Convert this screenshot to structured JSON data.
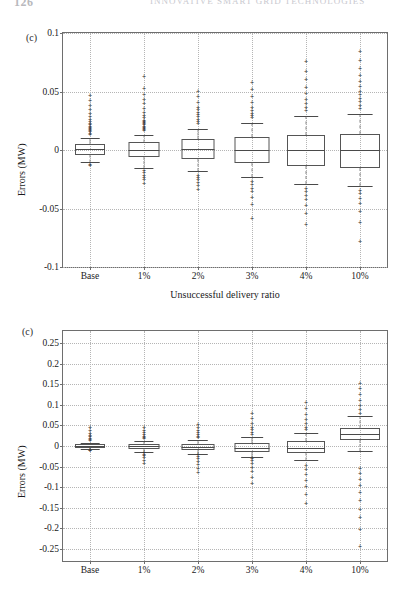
{
  "header": {
    "folio": "126",
    "running_title": "Innovative Smart Grid Technologies"
  },
  "panels": [
    {
      "tag": "(c)",
      "ylabel": "Errors (MW)",
      "xlabel": "Unsuccessful delivery ratio",
      "yticks": [
        "0.1",
        "0.05",
        "0",
        "-0.05",
        "-0.1"
      ],
      "xticks": [
        "Base",
        "1%",
        "2%",
        "3%",
        "4%",
        "10%"
      ]
    },
    {
      "tag": "(c)",
      "ylabel": "Errors (MW)",
      "xlabel": "",
      "yticks": [
        "0.25",
        "0.2",
        "0.15",
        "0.1",
        "0.05",
        "0",
        "-0.05",
        "-0.1",
        "-0.15",
        "-0.2",
        "-0.25"
      ],
      "xticks": [
        "Base",
        "1%",
        "2%",
        "3%",
        "4%",
        "10%"
      ]
    }
  ],
  "chart_data": [
    {
      "type": "box",
      "title": "(c)",
      "xlabel": "Unsuccessful delivery ratio",
      "ylabel": "Errors (MW)",
      "categories": [
        "Base",
        "1%",
        "2%",
        "3%",
        "4%",
        "10%"
      ],
      "ylim": [
        -0.1,
        0.1
      ],
      "yticks": [
        0.1,
        0.05,
        0,
        -0.05,
        -0.1
      ],
      "grid": true,
      "legend": "none",
      "boxes": [
        {
          "category": "Base",
          "q1": -0.004,
          "median": 0.001,
          "q3": 0.005,
          "whisker_low": -0.01,
          "whisker_high": 0.01,
          "outliers": [
            0.013,
            0.014,
            0.015,
            0.016,
            0.017,
            0.018,
            0.019,
            0.02,
            0.021,
            0.022,
            0.024,
            0.026,
            0.028,
            0.031,
            0.034,
            0.038,
            0.042,
            0.046,
            -0.013,
            -0.014
          ]
        },
        {
          "category": "1%",
          "q1": -0.006,
          "median": 0.0,
          "q3": 0.007,
          "whisker_low": -0.015,
          "whisker_high": 0.013,
          "outliers": [
            0.016,
            0.017,
            0.018,
            0.019,
            0.02,
            0.021,
            0.022,
            0.023,
            0.024,
            0.025,
            0.027,
            0.029,
            0.032,
            0.035,
            0.039,
            0.043,
            0.047,
            0.052,
            0.062,
            -0.018,
            -0.02,
            -0.022,
            -0.024,
            -0.026,
            -0.029
          ]
        },
        {
          "category": "2%",
          "q1": -0.008,
          "median": 0.001,
          "q3": 0.009,
          "whisker_low": -0.018,
          "whisker_high": 0.018,
          "outliers": [
            0.022,
            0.024,
            0.026,
            0.028,
            0.03,
            0.032,
            0.034,
            0.036,
            0.04,
            0.045,
            0.05,
            -0.022,
            -0.024,
            -0.026,
            -0.028,
            -0.031,
            -0.034
          ]
        },
        {
          "category": "3%",
          "q1": -0.011,
          "median": 0.0,
          "q3": 0.011,
          "whisker_low": -0.023,
          "whisker_high": 0.023,
          "outliers": [
            0.027,
            0.029,
            0.031,
            0.033,
            0.036,
            0.04,
            0.045,
            0.051,
            0.057,
            -0.027,
            -0.03,
            -0.033,
            -0.036,
            -0.041,
            -0.047,
            -0.059
          ]
        },
        {
          "category": "4%",
          "q1": -0.014,
          "median": 0.0,
          "q3": 0.013,
          "whisker_low": -0.029,
          "whisker_high": 0.029,
          "outliers": [
            0.033,
            0.036,
            0.039,
            0.043,
            0.048,
            0.053,
            0.06,
            0.067,
            0.075,
            -0.033,
            -0.036,
            -0.039,
            -0.043,
            -0.048,
            -0.055,
            -0.064
          ]
        },
        {
          "category": "10%",
          "q1": -0.015,
          "median": 0.0,
          "q3": 0.014,
          "whisker_low": -0.031,
          "whisker_high": 0.031,
          "outliers": [
            0.035,
            0.038,
            0.041,
            0.044,
            0.047,
            0.05,
            0.054,
            0.058,
            0.063,
            0.069,
            0.076,
            0.084,
            -0.035,
            -0.038,
            -0.042,
            -0.046,
            -0.053,
            -0.062,
            -0.079
          ]
        }
      ]
    },
    {
      "type": "box",
      "title": "(c)",
      "xlabel": "",
      "ylabel": "Errors (MW)",
      "categories": [
        "Base",
        "1%",
        "2%",
        "3%",
        "4%",
        "10%"
      ],
      "ylim": [
        -0.28,
        0.28
      ],
      "yticks": [
        0.25,
        0.2,
        0.15,
        0.1,
        0.05,
        0,
        -0.05,
        -0.1,
        -0.15,
        -0.2,
        -0.25
      ],
      "grid": true,
      "legend": "none",
      "boxes": [
        {
          "category": "Base",
          "q1": -0.004,
          "median": 0.0,
          "q3": 0.004,
          "whisker_low": -0.008,
          "whisker_high": 0.008,
          "outliers": [
            0.012,
            0.015,
            0.018,
            0.021,
            0.025,
            0.03,
            0.036,
            0.043,
            -0.011,
            -0.013
          ]
        },
        {
          "category": "1%",
          "q1": -0.007,
          "median": -0.001,
          "q3": 0.005,
          "whisker_low": -0.014,
          "whisker_high": 0.012,
          "outliers": [
            0.016,
            0.019,
            0.022,
            0.026,
            0.031,
            0.037,
            0.044,
            -0.018,
            -0.021,
            -0.025,
            -0.03,
            -0.036,
            -0.043
          ]
        },
        {
          "category": "2%",
          "q1": -0.01,
          "median": -0.003,
          "q3": 0.005,
          "whisker_low": -0.019,
          "whisker_high": 0.015,
          "outliers": [
            0.019,
            0.022,
            0.026,
            0.031,
            0.037,
            0.044,
            0.052,
            -0.023,
            -0.027,
            -0.032,
            -0.038,
            -0.046,
            -0.055,
            -0.066
          ]
        },
        {
          "category": "3%",
          "q1": -0.014,
          "median": -0.004,
          "q3": 0.007,
          "whisker_low": -0.026,
          "whisker_high": 0.022,
          "outliers": [
            0.027,
            0.032,
            0.038,
            0.045,
            0.054,
            0.065,
            0.078,
            -0.031,
            -0.037,
            -0.044,
            -0.053,
            -0.064,
            -0.077,
            -0.092
          ]
        },
        {
          "category": "4%",
          "q1": -0.018,
          "median": -0.004,
          "q3": 0.012,
          "whisker_low": -0.035,
          "whisker_high": 0.032,
          "outliers": [
            0.038,
            0.045,
            0.053,
            0.063,
            0.075,
            0.089,
            0.105,
            -0.048,
            -0.058,
            -0.07,
            -0.084,
            -0.1,
            -0.119,
            -0.141
          ]
        },
        {
          "category": "10%",
          "q1": 0.014,
          "median": 0.029,
          "q3": 0.045,
          "whisker_low": -0.012,
          "whisker_high": 0.072,
          "outliers": [
            0.079,
            0.088,
            0.098,
            0.11,
            0.123,
            0.138,
            0.152,
            -0.055,
            -0.068,
            -0.082,
            -0.098,
            -0.115,
            -0.134,
            -0.155,
            -0.175,
            -0.205,
            -0.245
          ]
        }
      ]
    }
  ]
}
